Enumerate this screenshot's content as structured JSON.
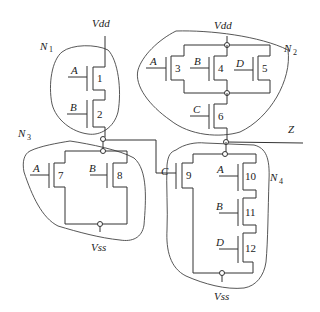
{
  "diagram": {
    "type": "CMOS transistor network",
    "rails": {
      "top": "Vdd",
      "bottom": "Vss"
    },
    "output": "Z",
    "networks": [
      {
        "id": "N1",
        "label": "N",
        "sub": "1",
        "transistors": [
          {
            "num": "1",
            "gate": "A"
          },
          {
            "num": "2",
            "gate": "B"
          }
        ],
        "topology": "series"
      },
      {
        "id": "N2",
        "label": "N",
        "sub": "2",
        "transistors": [
          {
            "num": "3",
            "gate": "A"
          },
          {
            "num": "4",
            "gate": "B"
          },
          {
            "num": "5",
            "gate": "D"
          },
          {
            "num": "6",
            "gate": "C"
          }
        ],
        "topology": "(3 || 4 || 5) series 6"
      },
      {
        "id": "N3",
        "label": "N",
        "sub": "3",
        "transistors": [
          {
            "num": "7",
            "gate": "A"
          },
          {
            "num": "8",
            "gate": "B"
          }
        ],
        "topology": "parallel"
      },
      {
        "id": "N4",
        "label": "N",
        "sub": "4",
        "transistors": [
          {
            "num": "9",
            "gate": "C"
          },
          {
            "num": "10",
            "gate": "A"
          },
          {
            "num": "11",
            "gate": "B"
          },
          {
            "num": "12",
            "gate": "D"
          }
        ],
        "topology": "9 || (10 series 11 series 12)"
      }
    ]
  },
  "labels": {
    "vdd_left": "Vdd",
    "vdd_right": "Vdd",
    "vss_left": "Vss",
    "vss_right": "Vss",
    "z": "Z",
    "n1": "N",
    "n1_sub": "1",
    "n2": "N",
    "n2_sub": "2",
    "n3": "N",
    "n3_sub": "3",
    "n4": "N",
    "n4_sub": "4",
    "t1": "1",
    "t1_gate": "A",
    "t2": "2",
    "t2_gate": "B",
    "t3": "3",
    "t3_gate": "A",
    "t4": "4",
    "t4_gate": "B",
    "t5": "5",
    "t5_gate": "D",
    "t6": "6",
    "t6_gate": "C",
    "t7": "7",
    "t7_gate": "A",
    "t8": "8",
    "t8_gate": "B",
    "t9": "9",
    "t9_gate": "C",
    "t10": "10",
    "t10_gate": "A",
    "t11": "11",
    "t11_gate": "B",
    "t12": "12",
    "t12_gate": "D"
  }
}
